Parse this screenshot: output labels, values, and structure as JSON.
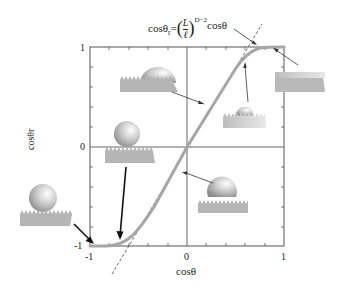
{
  "diagram": {
    "type": "wetting-transition-curve",
    "x_axis": {
      "label": "cosθ",
      "ticks": [
        "-1",
        "0",
        "1"
      ],
      "range": [
        -1,
        1
      ]
    },
    "y_axis": {
      "label": "cosθr",
      "ticks": [
        "1",
        "0",
        "-1"
      ],
      "range": [
        -1,
        1
      ]
    },
    "annotations": {
      "formula": "cosθr = (L/ℓ)^(D−2)",
      "formula_lhs": "cosθ",
      "formula_sub": "r",
      "formula_eq": "=",
      "formula_num": "L",
      "formula_den": "ℓ",
      "formula_exp": "D−2",
      "tangent_label": "cosθ"
    },
    "curve_color": "#a6a6a6",
    "frame_color": "#555555",
    "insets": [
      {
        "id": "top-left",
        "description": "drop partially wetting rough surface"
      },
      {
        "id": "mid-left",
        "description": "sphere resting on rough surface tips"
      },
      {
        "id": "bottom-left",
        "description": "sphere resting on rough surface (superhydrophobic)"
      },
      {
        "id": "bottom-right",
        "description": "sphere sitting on rough surface"
      },
      {
        "id": "center-right",
        "description": "flattened drop on rough surface"
      },
      {
        "id": "far-right",
        "description": "completely wetted rough surface"
      }
    ]
  }
}
